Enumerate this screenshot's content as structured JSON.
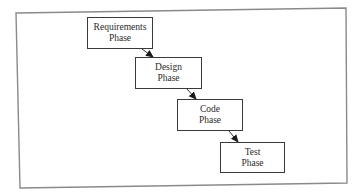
{
  "diagram": {
    "type": "waterfall-process",
    "frame": {
      "corners": [
        [
          16,
          13
        ],
        [
          346,
          8
        ],
        [
          347,
          183
        ],
        [
          20,
          188
        ]
      ],
      "color": "#8a8a8a"
    },
    "phases": [
      {
        "id": "requirements",
        "line1": "Requirements",
        "line2": "Phase",
        "x": 87,
        "y": 17,
        "w": 66,
        "h": 32
      },
      {
        "id": "design",
        "line1": "Design",
        "line2": "Phase",
        "x": 135,
        "y": 57,
        "w": 67,
        "h": 32
      },
      {
        "id": "code",
        "line1": "Code",
        "line2": "Phase",
        "x": 177,
        "y": 99,
        "w": 66,
        "h": 32
      },
      {
        "id": "test",
        "line1": "Test",
        "line2": "Phase",
        "x": 220,
        "y": 142,
        "w": 65,
        "h": 31
      }
    ],
    "arrows": [
      {
        "from": "requirements",
        "to": "design",
        "x1": 142,
        "y1": 49,
        "x2": 153,
        "y2": 57
      },
      {
        "from": "design",
        "to": "code",
        "x1": 187,
        "y1": 89,
        "x2": 196,
        "y2": 99
      },
      {
        "from": "code",
        "to": "test",
        "x1": 229,
        "y1": 131,
        "x2": 238,
        "y2": 142
      }
    ],
    "colors": {
      "box_border": "#3a3a3a",
      "text": "#2a2a2a",
      "arrow": "#1a1a1a",
      "background": "#ffffff"
    }
  }
}
